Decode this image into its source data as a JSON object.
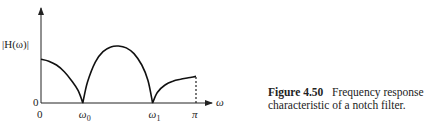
{
  "chart_data": {
    "type": "line",
    "title": "",
    "xlabel": "ω",
    "ylabel": "|H(ω)|",
    "x_tick_labels": [
      "0",
      "ω0",
      "ω1",
      "π"
    ],
    "x_tick_positions": [
      0,
      0.27,
      0.72,
      1.0
    ],
    "y_tick_labels": [
      "0"
    ],
    "xlim": [
      0,
      1.0
    ],
    "ylim": [
      0,
      1.0
    ],
    "grid": false,
    "series": [
      {
        "name": "|H(ω)|",
        "x": [
          0,
          0.05,
          0.1,
          0.15,
          0.2,
          0.24,
          0.27,
          0.3,
          0.35,
          0.4,
          0.45,
          0.5,
          0.55,
          0.6,
          0.65,
          0.69,
          0.72,
          0.75,
          0.8,
          0.85,
          0.9,
          0.95,
          1.0
        ],
        "y": [
          0.46,
          0.44,
          0.4,
          0.33,
          0.23,
          0.13,
          0.0,
          0.22,
          0.43,
          0.54,
          0.59,
          0.6,
          0.58,
          0.52,
          0.4,
          0.24,
          0.0,
          0.11,
          0.19,
          0.23,
          0.25,
          0.265,
          0.28
        ]
      }
    ],
    "annotations": [
      {
        "type": "dashed-vertical",
        "at": "π",
        "from": 0,
        "to": 0.28
      }
    ]
  },
  "caption": {
    "figure_label": "Figure 4.50",
    "text": "Frequency response characteristic of a notch filter."
  }
}
